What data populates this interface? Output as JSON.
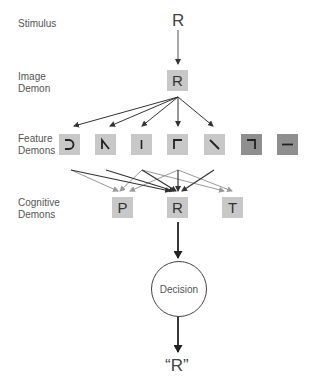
{
  "labels": {
    "stimulus": "Stimulus",
    "image_demon": [
      "Image",
      "Demon"
    ],
    "feature_demons": [
      "Feature",
      "Demons"
    ],
    "cognitive_demons": [
      "Cognitive",
      "Demons"
    ]
  },
  "stimulus_letter": "R",
  "image_demon_letter": "R",
  "feature_demons": [
    {
      "name": "curve-right",
      "shade": "light"
    },
    {
      "name": "diagonal-left-with-bar",
      "shade": "light"
    },
    {
      "name": "vertical-line",
      "shade": "light"
    },
    {
      "name": "corner-top-left",
      "shade": "light"
    },
    {
      "name": "diagonal-backslash",
      "shade": "light"
    },
    {
      "name": "corner-top-right",
      "shade": "dark"
    },
    {
      "name": "horizontal-line",
      "shade": "dark"
    }
  ],
  "cognitive_demons": [
    "P",
    "R",
    "T"
  ],
  "decision_label": "Decision",
  "output": "“R”"
}
